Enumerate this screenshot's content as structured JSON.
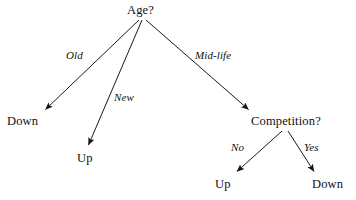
{
  "diagram": {
    "type": "decision-tree",
    "background_color": "#ffffff",
    "line_color": "#1a1a1a",
    "text_color": "#111111"
  },
  "nodes": {
    "root": {
      "label": "Age?",
      "kind": "question"
    },
    "competition": {
      "label": "Competition?",
      "kind": "question"
    },
    "down_old": {
      "label": "Down",
      "kind": "outcome"
    },
    "up_new": {
      "label": "Up",
      "kind": "outcome"
    },
    "up_no": {
      "label": "Up",
      "kind": "outcome"
    },
    "down_yes": {
      "label": "Down",
      "kind": "outcome"
    }
  },
  "edges": {
    "old": {
      "label": "Old",
      "from": "Age?",
      "to": "Down"
    },
    "new": {
      "label": "New",
      "from": "Age?",
      "to": "Up"
    },
    "midlife": {
      "label": "Mid-life",
      "from": "Age?",
      "to": "Competition?"
    },
    "no": {
      "label": "No",
      "from": "Competition?",
      "to": "Up"
    },
    "yes": {
      "label": "Yes",
      "from": "Competition?",
      "to": "Down"
    }
  }
}
